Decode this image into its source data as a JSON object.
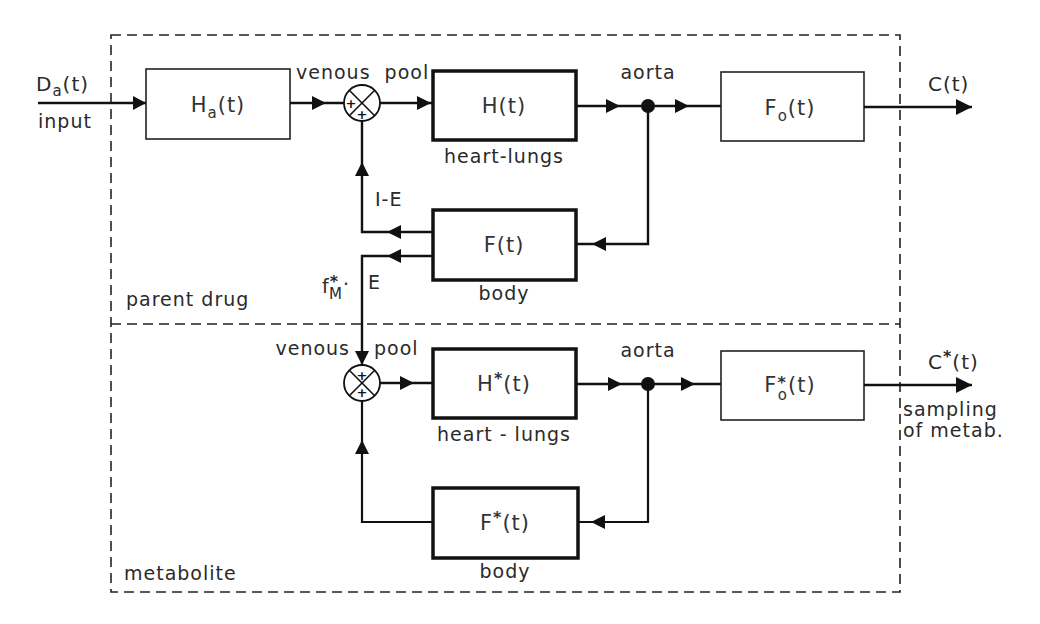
{
  "sections": {
    "parent": {
      "label": "parent drug"
    },
    "metabolite": {
      "label": "metabolite"
    }
  },
  "input": {
    "signal": "D",
    "signal_sub": "a",
    "signal_arg": "(t)",
    "label": "input"
  },
  "parent": {
    "ha_box": {
      "main": "H",
      "sub": "a",
      "arg": "(t)"
    },
    "venous_pool": "venous  pool",
    "h_box": {
      "main": "H(t)",
      "caption": "heart-lungs"
    },
    "aorta": "aorta",
    "fo_box": {
      "main": "F",
      "sub": "o",
      "arg": "(t)"
    },
    "output": "C(t)",
    "f_box": {
      "main": "F(t)",
      "caption": "body"
    },
    "recirc_label": "I-E",
    "metab_fraction": {
      "f": "f",
      "sup": "*",
      "sub": "M",
      "dot": "·",
      "e": "E"
    }
  },
  "metab": {
    "venous_pool_left": "venous",
    "venous_pool_right": "pool",
    "h_box": {
      "main": "H",
      "sup": "*",
      "arg": "(t)",
      "caption": "heart - lungs"
    },
    "aorta": "aorta",
    "fo_box": {
      "main": "F",
      "sup": "*",
      "sub": "o",
      "arg": "(t)"
    },
    "output": {
      "main": "C",
      "sup": "*",
      "arg": "(t)"
    },
    "output_note_1": "sampling",
    "output_note_2": "of metab.",
    "f_box": {
      "main": "F",
      "sup": "*",
      "arg": "(t)",
      "caption": "body"
    }
  },
  "junction": {
    "plus": "+"
  }
}
